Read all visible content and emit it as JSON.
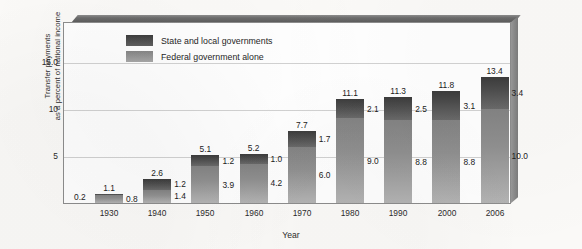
{
  "chart_data": {
    "type": "bar",
    "subtype": "stacked",
    "title": "",
    "xlabel": "Year",
    "ylabel": "Transfer payments as a percent of national income",
    "ylabel_line1": "Transfer payments",
    "ylabel_line2": "as a percent of national income",
    "categories": [
      "1930",
      "1940",
      "1950",
      "1960",
      "1970",
      "1980",
      "1990",
      "2000",
      "2006"
    ],
    "series": [
      {
        "name": "Federal government alone",
        "values": [
          0.8,
          1.4,
          3.9,
          4.2,
          6.0,
          9.0,
          8.8,
          8.8,
          10.0
        ]
      },
      {
        "name": "State and local governments",
        "values": [
          0.2,
          1.2,
          1.2,
          1.0,
          1.7,
          2.1,
          2.5,
          3.1,
          3.4
        ]
      }
    ],
    "totals": [
      1.1,
      2.6,
      5.1,
      5.2,
      7.7,
      11.1,
      11.3,
      11.8,
      13.4
    ],
    "state_local_label_overrides": [
      "0.2",
      "1.2",
      "1.2",
      "1.0",
      "1.7",
      "2.1",
      "2.5",
      "3.1",
      "3.4"
    ],
    "federal_labels": [
      "0.8",
      "1.4",
      "3.9",
      "4.2",
      "6.0",
      "9.0",
      "8.8",
      "8.8",
      "10.0"
    ],
    "total_labels": [
      "1.1",
      "2.6",
      "5.1",
      "5.2",
      "7.7",
      "11.1",
      "11.3",
      "11.8",
      "13.4"
    ],
    "ylim": [
      0,
      19.4
    ],
    "yticks": [
      5,
      10,
      15
    ],
    "ytick_labels": [
      "5",
      "10",
      "15.0"
    ],
    "grid": true,
    "legend_position": "top-left-inside",
    "colors": {
      "state_and_local": "#4c4c4c",
      "federal": "#909090",
      "gridline": "#d2d2d2",
      "frame": "#8d8d8d",
      "plot_background": "#ffffff",
      "page_background": "#fbfaf8"
    }
  },
  "legend": {
    "items": [
      {
        "label": "State and local governments",
        "key": "state"
      },
      {
        "label": "Federal government alone",
        "key": "federal"
      }
    ]
  }
}
